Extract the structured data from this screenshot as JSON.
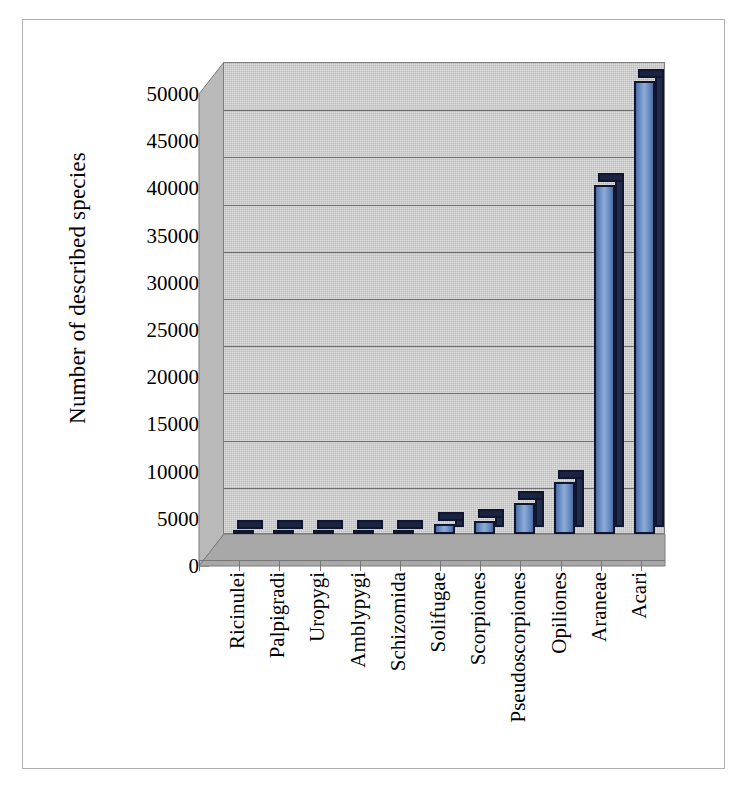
{
  "figure": {
    "border_color": "#b0b0b0",
    "background": "#ffffff"
  },
  "chart_data": {
    "type": "bar",
    "title": "",
    "xlabel": "",
    "ylabel": "Number of described species",
    "ylim": [
      0,
      50000
    ],
    "ytick_step": 5000,
    "grid": true,
    "legend": "none",
    "style": "3d-column",
    "plot_background": "#c9c9c9",
    "bar_color": "#6e92c6",
    "bar_edge_color": "#10162e",
    "categories": [
      "Ricinulei",
      "Palpigradi",
      "Uropygi",
      "Amblypygi",
      "Schizomida",
      "Solifugae",
      "Scorpiones",
      "Pseudoscorpiones",
      "Opiliones",
      "Araneae",
      "Acari"
    ],
    "values": [
      60,
      80,
      100,
      140,
      180,
      1100,
      1400,
      3300,
      5500,
      37000,
      48000
    ],
    "yticklabels": [
      "0",
      "5000",
      "10000",
      "15000",
      "20000",
      "25000",
      "30000",
      "35000",
      "40000",
      "45000",
      "50000"
    ],
    "ytickvalues": [
      0,
      5000,
      10000,
      15000,
      20000,
      25000,
      30000,
      35000,
      40000,
      45000,
      50000
    ]
  }
}
